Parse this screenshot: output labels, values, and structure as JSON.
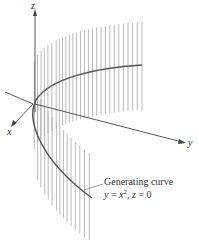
{
  "figure": {
    "type": "parabolic-cylinder",
    "axes": {
      "x_label": "x",
      "y_label": "y",
      "z_label": "z"
    },
    "annotation": {
      "line1": "Generating curve",
      "line2_prefix": "y",
      "line2_eq": " = ",
      "line2_var": "x",
      "line2_exp": "2",
      "line2_sep": ", ",
      "line2_z": "z",
      "line2_rest": " = 0"
    },
    "colors": {
      "surface_lines": "#a8a8a8",
      "curve": "#555555",
      "axes": "#444444",
      "text": "#333333"
    }
  }
}
